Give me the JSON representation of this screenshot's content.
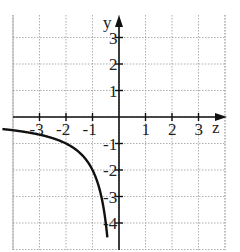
{
  "chart_data": {
    "type": "line",
    "title": "",
    "xlabel": "z",
    "ylabel": "y",
    "xlim": [
      -4,
      4
    ],
    "ylim": [
      -5,
      4
    ],
    "grid": true,
    "x_ticks": [
      -3,
      -2,
      -1,
      1,
      2,
      3
    ],
    "y_ticks": [
      3,
      2,
      1,
      -1,
      -2,
      -3,
      -4
    ],
    "x_tick_labels": [
      "-3",
      "-2",
      "-1",
      "1",
      "2",
      "3"
    ],
    "y_tick_labels": [
      "3",
      "2",
      "1",
      "-1",
      "-2",
      "-3",
      "-4"
    ],
    "series": [
      {
        "name": "y = 2/z (z<0)",
        "x": [
          -4.4,
          -4,
          -3,
          -2,
          -1.5,
          -1,
          -0.8,
          -0.7,
          -0.6,
          -0.5,
          -0.45
        ],
        "y": [
          -0.45,
          -0.5,
          -0.67,
          -1,
          -1.33,
          -2,
          -2.5,
          -2.86,
          -3.33,
          -4,
          -4.44
        ]
      }
    ],
    "colors": {
      "axis": "#111111",
      "grid": "#9a9a9a",
      "curve": "#111111"
    }
  },
  "labels": {
    "x_axis": "z",
    "y_axis": "y"
  }
}
